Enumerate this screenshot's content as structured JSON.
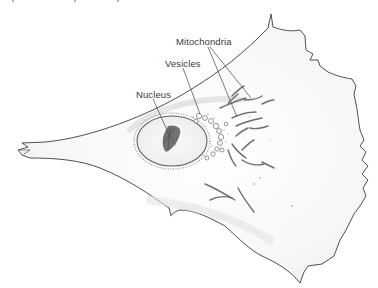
{
  "figure": {
    "type": "line-art illustration",
    "labels": [
      {
        "id": "mitochondria",
        "text": "Mitochondria",
        "x": 176,
        "y": 41
      },
      {
        "id": "vesicles",
        "text": "Vesicles",
        "x": 165,
        "y": 61
      },
      {
        "id": "nucleus",
        "text": "Nucleus",
        "x": 136,
        "y": 92
      }
    ],
    "colors": {
      "outline": "#3c3c3c",
      "fill": "#f7f7f7",
      "shading": "#d9d9d9",
      "mitochondria": "#6e6e6e",
      "label_text": "#3a3a3a",
      "leader_line": "#444444",
      "background": "#ffffff"
    }
  }
}
